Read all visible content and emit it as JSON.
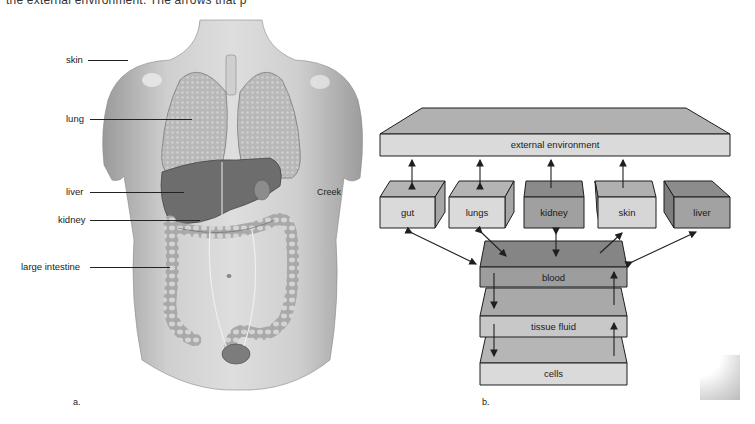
{
  "caption": {
    "top_text_partial": "the external environment. The arrows that p"
  },
  "panel_a": {
    "letter": "a.",
    "credit": "Creek",
    "labels": [
      {
        "id": "skin",
        "text": "skin"
      },
      {
        "id": "lung",
        "text": "lung"
      },
      {
        "id": "liver",
        "text": "liver"
      },
      {
        "id": "kidney",
        "text": "kidney"
      },
      {
        "id": "large_intestine",
        "text": "large intestine"
      }
    ],
    "illustration": "anatomical-torso-illustration"
  },
  "panel_b": {
    "letter": "b.",
    "external_environment": "external environment",
    "organs": [
      {
        "id": "gut",
        "label": "gut",
        "arrow_to_env": "bidirectional",
        "arrow_to_blood": "bidirectional"
      },
      {
        "id": "lungs",
        "label": "lungs",
        "arrow_to_env": "bidirectional",
        "arrow_to_blood": "bidirectional"
      },
      {
        "id": "kidney",
        "label": "kidney",
        "arrow_to_env": "up",
        "arrow_to_blood": "bidirectional"
      },
      {
        "id": "skin",
        "label": "skin",
        "arrow_to_env": "up",
        "arrow_to_blood": "toward-skin"
      },
      {
        "id": "liver",
        "label": "liver",
        "arrow_to_env": "none",
        "arrow_to_blood": "bidirectional"
      }
    ],
    "layers": [
      {
        "id": "blood",
        "label": "blood"
      },
      {
        "id": "tissue_fluid",
        "label": "tissue fluid"
      },
      {
        "id": "cells",
        "label": "cells"
      }
    ],
    "colors": {
      "light_front": "#d9d9d9",
      "light_top": "#b3b3b3",
      "dark_front": "#9a9a9a",
      "dark_top": "#858585",
      "outline": "#1f1f1f"
    }
  }
}
